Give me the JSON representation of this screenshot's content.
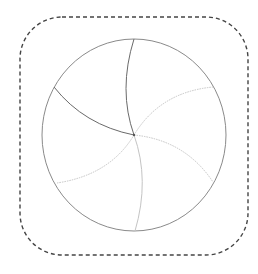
{
  "diagram": {
    "colors": {
      "background": "#ffffff",
      "frame": "#444444",
      "circle": "#8a8a8a",
      "spoke_dark": "#6a6a6a",
      "spoke_light": "#c4c4c4"
    },
    "frame": {
      "x": 20,
      "y": 17,
      "width": 228,
      "height": 238,
      "radius": 42,
      "style": "dashed"
    },
    "circle": {
      "cx": 134,
      "cy": 135,
      "rx": 92,
      "ry": 96
    },
    "center": {
      "x": 134,
      "y": 135
    },
    "spokes": [
      {
        "name": "top",
        "end": [
          134,
          39
        ],
        "tone": "dark",
        "dotted": false
      },
      {
        "name": "upper-left",
        "end": [
          54,
          87
        ],
        "tone": "dark",
        "dotted": false
      },
      {
        "name": "lower-left",
        "end": [
          57,
          183
        ],
        "tone": "light",
        "dotted": true
      },
      {
        "name": "bottom",
        "end": [
          135,
          231
        ],
        "tone": "light",
        "dotted": false
      },
      {
        "name": "lower-right",
        "end": [
          213,
          182
        ],
        "tone": "light",
        "dotted": true
      },
      {
        "name": "upper-right",
        "end": [
          213,
          87
        ],
        "tone": "light",
        "dotted": true
      }
    ]
  }
}
